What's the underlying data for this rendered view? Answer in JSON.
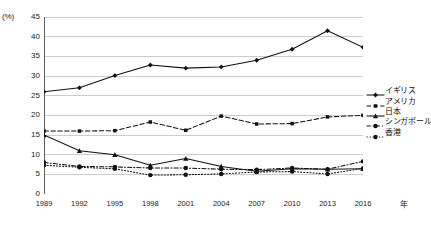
{
  "chart_data": {
    "type": "line",
    "title": "",
    "xlabel": "年",
    "ylabel": "(%)",
    "ylim": [
      0,
      45
    ],
    "ystep": 5,
    "grid": true,
    "legend_position": "right",
    "categories": [
      "1989",
      "1992",
      "1995",
      "1998",
      "2001",
      "2004",
      "2007",
      "2010",
      "2013",
      "2016"
    ],
    "yticks": [
      "0",
      "5",
      "10",
      "15",
      "20",
      "25",
      "30",
      "35",
      "40",
      "45"
    ],
    "series": [
      {
        "name": "イギリス",
        "style": "solid",
        "marker": "diamond",
        "color": "#111111",
        "values": [
          26.0,
          27.0,
          30.1,
          32.8,
          32.0,
          32.3,
          34.0,
          36.8,
          41.5,
          37.3
        ]
      },
      {
        "name": "アメリカ",
        "style": "dashed",
        "marker": "square",
        "color": "#111111",
        "values": [
          16.0,
          16.0,
          16.1,
          18.3,
          16.2,
          19.8,
          17.8,
          17.9,
          19.6,
          20.0
        ]
      },
      {
        "name": "日本",
        "style": "solid",
        "marker": "triangle",
        "color": "#111111",
        "values": [
          15.0,
          11.0,
          10.0,
          7.3,
          9.0,
          7.0,
          5.8,
          6.4,
          6.3,
          6.4
        ]
      },
      {
        "name": "シンガポール",
        "style": "dashdot",
        "marker": "circle",
        "color": "#111111",
        "values": [
          8.0,
          7.0,
          6.9,
          6.6,
          6.6,
          6.3,
          6.2,
          6.6,
          6.3,
          8.3
        ]
      },
      {
        "name": "香港",
        "style": "dotted",
        "marker": "circle",
        "color": "#111111",
        "values": [
          7.3,
          6.8,
          6.4,
          4.8,
          4.9,
          5.1,
          5.6,
          5.7,
          5.1,
          6.5
        ]
      }
    ]
  }
}
